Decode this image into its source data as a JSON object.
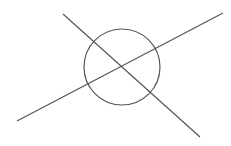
{
  "canvas": {
    "width": 231,
    "height": 146,
    "background": "#ffffff"
  },
  "stroke": {
    "color": "#555555",
    "width": 1.2
  },
  "circle": {
    "cx": 122,
    "cy": 67,
    "r": 38
  },
  "lines": [
    {
      "x1": 63,
      "y1": 14,
      "x2": 200,
      "y2": 137
    },
    {
      "x1": 17,
      "y1": 121,
      "x2": 223,
      "y2": 13
    }
  ]
}
